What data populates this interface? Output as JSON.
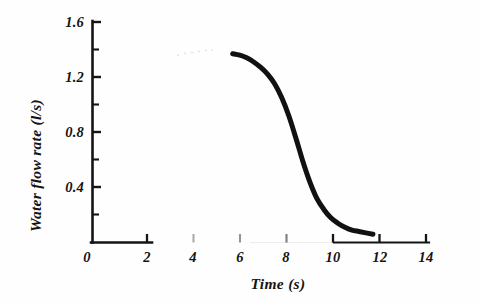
{
  "figure": {
    "background_color": "#fefefe",
    "ink_color": "#141414",
    "curve_color": "#111111"
  },
  "chart_data": {
    "type": "line",
    "title": "",
    "subtitle": "",
    "xlabel": "Time (s)",
    "ylabel": "Water flow rate (l/s)",
    "xlim": [
      0,
      14.4
    ],
    "ylim": [
      0,
      1.6
    ],
    "xticks": [
      0,
      2,
      4,
      6,
      8,
      10,
      12,
      14
    ],
    "xtick_labels": [
      "0",
      "2",
      "4",
      "6",
      "8",
      "10",
      "12",
      "14"
    ],
    "xminor_ticks": [
      1,
      3,
      5,
      7,
      9,
      11,
      13
    ],
    "yticks": [
      0.4,
      0.8,
      1.2,
      1.6
    ],
    "ytick_labels": [
      "0.4",
      "0.8",
      "1.2",
      "1.6"
    ],
    "yminor_ticks": [
      0.2,
      0.6,
      1.0,
      1.4
    ],
    "grid": false,
    "legend": null,
    "legend_position": "none",
    "annotations": [],
    "series": [
      {
        "name": "Water flow rate",
        "line_width_px": 5,
        "x": [
          6.0,
          6.3,
          6.6,
          6.9,
          7.2,
          7.5,
          7.8,
          8.1,
          8.4,
          8.7,
          9.0,
          9.3,
          9.6,
          9.9,
          10.2,
          10.5,
          10.8,
          11.1,
          11.4,
          11.7,
          12.0
        ],
        "y": [
          1.37,
          1.36,
          1.34,
          1.31,
          1.27,
          1.22,
          1.15,
          1.05,
          0.92,
          0.76,
          0.59,
          0.44,
          0.32,
          0.24,
          0.18,
          0.14,
          0.11,
          0.09,
          0.08,
          0.07,
          0.06
        ]
      }
    ]
  },
  "axes": {
    "x_axis_name": "time-axis",
    "y_axis_name": "flow-rate-axis"
  }
}
